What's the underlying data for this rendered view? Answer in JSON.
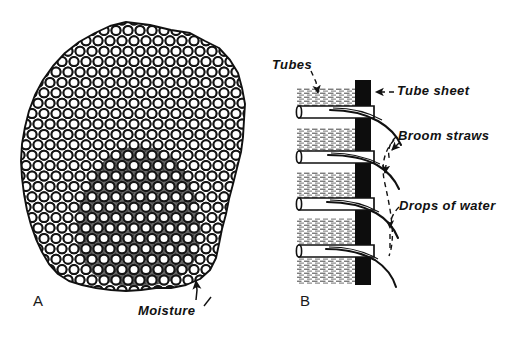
{
  "figure": {
    "type": "technical-illustration",
    "background_color": "#ffffff",
    "ink_color": "#111111",
    "panels": [
      {
        "id": "A",
        "letter": "A",
        "title": "Tube bundle cross section",
        "description": "Irregular rounded outline filled with a staggered hexagonal array of small circles representing tube ends; a dark shaded blob in the lower center represents trapped moisture.",
        "circle_grid": {
          "pattern": "staggered-hex",
          "spacing_x": 12,
          "spacing_y": 10.4,
          "circle_diameter": 9,
          "ring_thickness": 2
        },
        "shaded_region": {
          "name": "moisture-blob",
          "fill": "#2b2b2b",
          "opacity": 0.72
        },
        "labels": [
          {
            "name": "moisture-label",
            "text": "Moisture",
            "leader": "arrow-up"
          }
        ]
      },
      {
        "id": "B",
        "letter": "B",
        "title": "Tube sheet side view",
        "description": "Vertical black tube sheet bar with four horizontal tubes passing through it; curved broom straws extend from tube ends, and dashed leaders point to drops of water.",
        "tube_sheet": {
          "name": "tube-sheet-bar",
          "fill": "#0d0d0d",
          "x": 355,
          "y": 80,
          "width": 16,
          "height": 205
        },
        "tube_count": 4,
        "labels": [
          {
            "name": "tubes-label",
            "text": "Tubes",
            "leader": "dashed-down"
          },
          {
            "name": "tube-sheet-label",
            "text": "Tube sheet",
            "leader": "dashed-left-arrow"
          },
          {
            "name": "broom-straws-label",
            "text": "Broom straws",
            "leader": "dashed-curve"
          },
          {
            "name": "drops-of-water-label",
            "text": "Drops of water",
            "leader": "dashed-curve"
          }
        ]
      }
    ]
  },
  "labels": {
    "tubes": "Tubes",
    "tube_sheet": "Tube sheet",
    "broom_straws": "Broom straws",
    "drops_of_water": "Drops of water",
    "moisture": "Moisture",
    "panel_a": "A",
    "panel_b": "B"
  }
}
